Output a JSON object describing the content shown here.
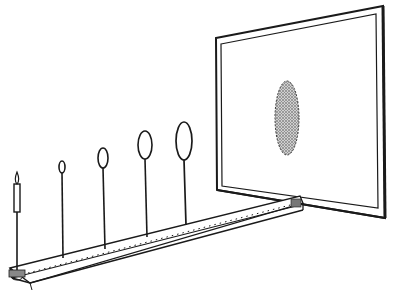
{
  "diagram": {
    "title": "",
    "elements": {
      "light_source": "candle",
      "apertures": [
        "ring-1",
        "ring-2",
        "ring-3",
        "ring-4"
      ],
      "screen": "projection-screen",
      "projection": "elliptical-shadow"
    },
    "colors": {
      "ink": "#1a1a1a",
      "background": "#ffffff",
      "shadow_fill": "#9a9a9a"
    }
  }
}
